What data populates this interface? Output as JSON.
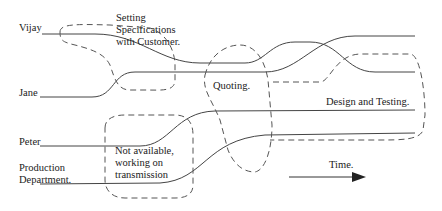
{
  "diagram": {
    "people": [
      {
        "name": "Vijay"
      },
      {
        "name": "Jane"
      },
      {
        "name": "Peter"
      },
      {
        "name": "Production\nDepartment."
      }
    ],
    "activities": [
      {
        "label": "Setting\nSpecifications\nwith Customer."
      },
      {
        "label": "Quoting."
      },
      {
        "label": "Design and Testing."
      },
      {
        "label": "Not available,\nworking on\ntransmission"
      }
    ],
    "time_label": "Time.",
    "colors": {
      "line": "#444444",
      "dash": "#555555",
      "text": "#222222"
    }
  }
}
